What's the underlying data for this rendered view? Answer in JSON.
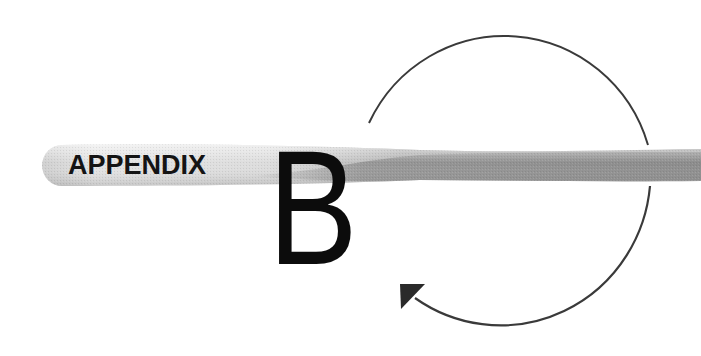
{
  "header": {
    "label": "APPENDIX",
    "letter": "B"
  },
  "decorations": {
    "band": "gray-swoosh-band",
    "cycle_arrow": "circular-arrow-icon"
  },
  "colors": {
    "text": "#141414",
    "band_light": "#e6e6e6",
    "band_mid": "#b5b5b5",
    "band_dark": "#8f8f8f",
    "arc": "#3a3a3a",
    "background": "#ffffff"
  }
}
